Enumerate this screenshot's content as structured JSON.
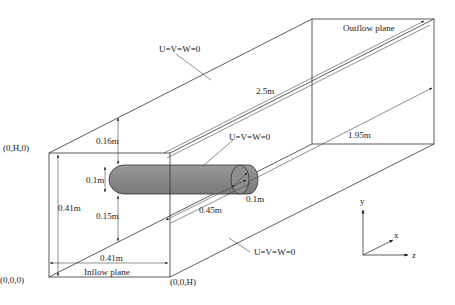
{
  "diagram": {
    "colors": {
      "line": "#333333",
      "cylinder_fill": "#8a8a8a",
      "background": "#ffffff"
    },
    "corner_labels": {
      "top_left": "(0,H,0)",
      "bottom_left": "(0,0,0)",
      "bottom_right": "(0,0,H)"
    },
    "planes": {
      "inflow": "Inflow plane",
      "outflow": "Outflow plane"
    },
    "boundary_conditions": {
      "top_wall": "U=V=W=0",
      "cylinder": "U=V=W=0",
      "bottom_wall": "U=V=W=0"
    },
    "dimensions": {
      "channel_length": "2.5m",
      "cylinder_to_outflow": "1.95m",
      "cylinder_to_inflow": "0.45m",
      "cylinder_diameter_front": "0.1m",
      "cylinder_diameter_end": "0.1m",
      "gap_top": "0.16m",
      "gap_bottom": "0.15m",
      "height": "0.41m",
      "width": "0.41m"
    },
    "axes": {
      "x": "x",
      "y": "y",
      "z": "z"
    }
  }
}
